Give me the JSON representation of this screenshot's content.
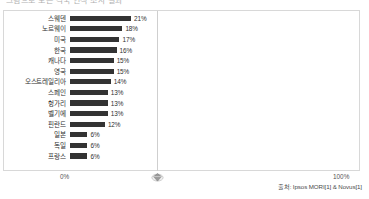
{
  "title_strip": {
    "text": "그림으로 보는 각국 인식 조사 결과"
  },
  "axis": {
    "left_tick": "0%",
    "right_tick": "100%",
    "marker_icon": "diamond-marker-icon"
  },
  "source": {
    "text": "출처: Ipsos MORI[1] & Novus[1]"
  },
  "colors": {
    "bar": "#333333",
    "frame": "#d8d8d8",
    "gridline": "#cfcfcf",
    "text": "#2f2f2f"
  },
  "chart_data": {
    "type": "bar",
    "orientation": "horizontal",
    "title": "",
    "xlabel": "",
    "ylabel": "",
    "xlim": [
      0,
      100
    ],
    "grid": false,
    "legend": "none",
    "tick_labels": [
      "0%",
      "100%"
    ],
    "value_suffix": "%",
    "categories": [
      "스웨덴",
      "노르웨이",
      "미국",
      "한국",
      "캐나다",
      "영국",
      "오스트레일리아",
      "스페인",
      "헝가리",
      "벨기에",
      "핀란드",
      "일본",
      "독일",
      "프랑스"
    ],
    "values": [
      21,
      18,
      17,
      16,
      15,
      15,
      14,
      13,
      13,
      13,
      12,
      6,
      6,
      6
    ],
    "labels": [
      "21%",
      "18%",
      "17%",
      "16%",
      "15%",
      "15%",
      "14%",
      "13%",
      "13%",
      "13%",
      "12%",
      "6%",
      "6%",
      "6%"
    ],
    "source": "출처: Ipsos MORI[1] & Novus[1]"
  }
}
